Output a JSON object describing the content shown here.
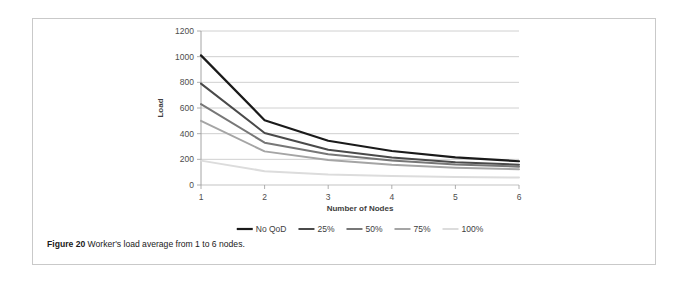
{
  "figure": {
    "caption_label": "Figure 20",
    "caption_text": "Worker's load average from 1 to 6 nodes."
  },
  "chart_data": {
    "type": "line",
    "title": "",
    "xlabel": "Number of Nodes",
    "ylabel": "Load",
    "categories": [
      "1",
      "2",
      "3",
      "4",
      "5",
      "6"
    ],
    "x": [
      1,
      2,
      3,
      4,
      5,
      6
    ],
    "xlim": [
      1,
      6
    ],
    "ylim": [
      0,
      1200
    ],
    "yticks": [
      0,
      200,
      400,
      600,
      800,
      1000,
      1200
    ],
    "ytick_labels": [
      "0",
      "200",
      "400",
      "600",
      "800",
      "1000",
      "1200"
    ],
    "grid": "horizontal",
    "legend_position": "bottom",
    "series": [
      {
        "name": "No QoD",
        "color": "#1a1a1a",
        "width": 2.2,
        "values": [
          1010,
          505,
          345,
          265,
          215,
          185
        ]
      },
      {
        "name": "25%",
        "color": "#4a4a4a",
        "width": 2.0,
        "values": [
          790,
          405,
          275,
          215,
          178,
          158
        ]
      },
      {
        "name": "50%",
        "color": "#777777",
        "width": 2.0,
        "values": [
          630,
          330,
          240,
          190,
          160,
          143
        ]
      },
      {
        "name": "75%",
        "color": "#a5a5a5",
        "width": 2.0,
        "values": [
          500,
          262,
          195,
          158,
          135,
          122
        ]
      },
      {
        "name": "100%",
        "color": "#dcdcdc",
        "width": 2.0,
        "values": [
          190,
          108,
          82,
          70,
          62,
          58
        ]
      }
    ]
  }
}
